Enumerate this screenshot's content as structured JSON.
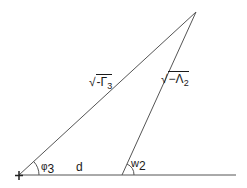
{
  "diagram": {
    "type": "geometric-triangle",
    "stroke_color": "#555555",
    "background": "#ffffff",
    "points": {
      "origin": {
        "x": 19,
        "y": 175
      },
      "apex": {
        "x": 196,
        "y": 12
      },
      "foot": {
        "x": 122,
        "y": 175
      },
      "baseline_end": {
        "x": 236,
        "y": 175
      }
    },
    "labels": {
      "hypotenuse": {
        "radical": "√",
        "body": "-Γ",
        "subscript": "3"
      },
      "right_side": {
        "radical": "√",
        "body": "−Λ",
        "subscript": "2"
      },
      "angle_origin": {
        "symbol": "φ",
        "subscript": "3"
      },
      "angle_foot": {
        "symbol": "w",
        "subscript": "2"
      },
      "base_segment": "d",
      "origin_marker": "+"
    }
  }
}
